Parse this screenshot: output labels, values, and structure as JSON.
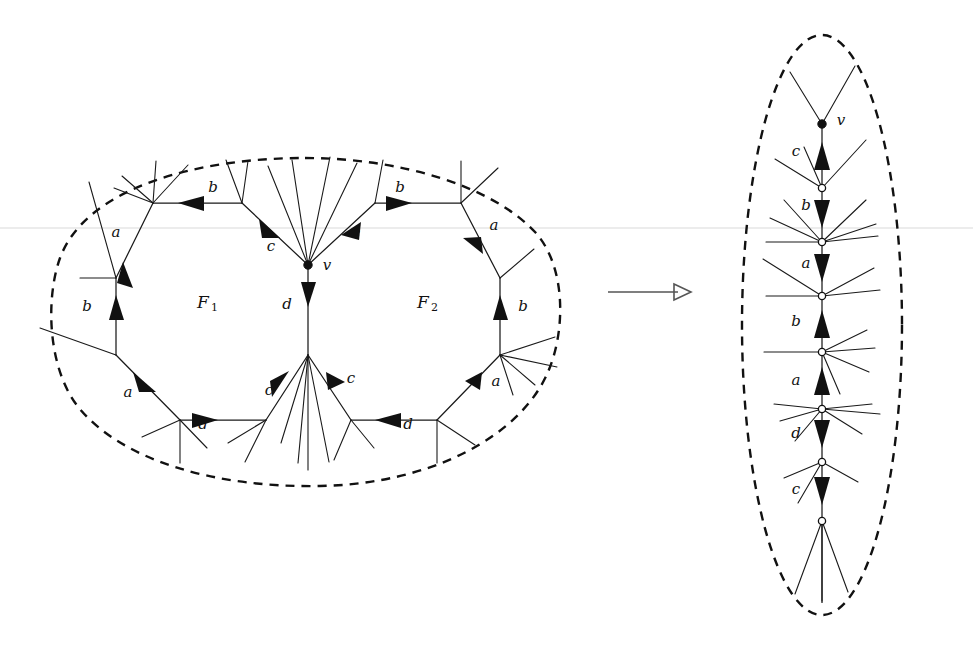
{
  "figure": {
    "width": 973,
    "height": 647,
    "background": "#ffffff",
    "ink_color": "#111111",
    "hairline_color": "#d9d9d9",
    "map_arrow_color": "#555555"
  },
  "transform_arrow": {
    "glyph": "open-arrow-right",
    "name": "maps-to-arrow",
    "x1": 608,
    "x2": 690,
    "y": 292
  },
  "left_panel": {
    "name": "source-embedding",
    "boundary": {
      "shape": "dashed-blob",
      "cx": 305,
      "cy": 325,
      "rx": 258,
      "ry": 167
    },
    "faces": [
      {
        "id": "F1",
        "label": "F",
        "subscript": "1",
        "x": 205,
        "y": 303
      },
      {
        "id": "F2",
        "label": "F",
        "subscript": "2",
        "x": 425,
        "y": 303
      }
    ],
    "center_vertex": {
      "id": "v",
      "label": "v",
      "x": 308,
      "y": 265,
      "label_x": 327,
      "label_y": 266
    },
    "lower_hub": {
      "id": "w",
      "x": 308,
      "y": 355
    },
    "edge_labels": [
      {
        "text": "b",
        "x": 213,
        "y": 188,
        "edge": "top-left-b"
      },
      {
        "text": "a",
        "x": 116,
        "y": 233,
        "edge": "upper-left-a"
      },
      {
        "text": "b",
        "x": 87,
        "y": 307,
        "edge": "left-b"
      },
      {
        "text": "a",
        "x": 128,
        "y": 393,
        "edge": "lower-left-a"
      },
      {
        "text": "d",
        "x": 203,
        "y": 425,
        "edge": "bottom-left-d"
      },
      {
        "text": "c",
        "x": 269,
        "y": 391,
        "edge": "bottom-left-c"
      },
      {
        "text": "c",
        "x": 271,
        "y": 247,
        "edge": "upper-inner-left-c"
      },
      {
        "text": "d",
        "x": 287,
        "y": 305,
        "edge": "center-d"
      },
      {
        "text": "c",
        "x": 356,
        "y": 234,
        "edge": "upper-inner-right-c"
      },
      {
        "text": "b",
        "x": 400,
        "y": 188,
        "edge": "top-right-b"
      },
      {
        "text": "a",
        "x": 494,
        "y": 226,
        "edge": "upper-right-a"
      },
      {
        "text": "b",
        "x": 523,
        "y": 307,
        "edge": "right-b"
      },
      {
        "text": "a",
        "x": 496,
        "y": 382,
        "edge": "lower-right-a"
      },
      {
        "text": "d",
        "x": 408,
        "y": 425,
        "edge": "bottom-right-d"
      },
      {
        "text": "c",
        "x": 351,
        "y": 379,
        "edge": "bottom-right-c"
      }
    ]
  },
  "right_panel": {
    "name": "folded-path",
    "boundary": {
      "shape": "dashed-ellipse",
      "cx": 822,
      "cy": 325,
      "rx": 80,
      "ry": 290
    },
    "spine_x": 822,
    "top_vertex": {
      "id": "v",
      "label": "v",
      "x": 822,
      "y": 124,
      "label_x": 841,
      "label_y": 121,
      "style": "filled"
    },
    "spine_nodes": [
      {
        "y": 124,
        "style": "filled"
      },
      {
        "y": 188,
        "style": "open"
      },
      {
        "y": 242,
        "style": "open"
      },
      {
        "y": 296,
        "style": "open"
      },
      {
        "y": 352,
        "style": "open"
      },
      {
        "y": 409,
        "style": "open"
      },
      {
        "y": 462,
        "style": "open"
      },
      {
        "y": 521,
        "style": "open"
      }
    ],
    "edge_labels": [
      {
        "text": "c",
        "x": 796,
        "y": 152,
        "direction": "up"
      },
      {
        "text": "b",
        "x": 806,
        "y": 206,
        "direction": "down"
      },
      {
        "text": "a",
        "x": 806,
        "y": 264,
        "direction": "down"
      },
      {
        "text": "b",
        "x": 796,
        "y": 322,
        "direction": "up"
      },
      {
        "text": "a",
        "x": 796,
        "y": 381,
        "direction": "up"
      },
      {
        "text": "d",
        "x": 796,
        "y": 434,
        "direction": "down"
      },
      {
        "text": "c",
        "x": 796,
        "y": 490,
        "direction": "down"
      }
    ]
  },
  "legend": {
    "filled_node_meaning": "distinguished vertex v",
    "open_node_meaning": "identified vertex class",
    "dashed_meaning": "region boundary"
  }
}
